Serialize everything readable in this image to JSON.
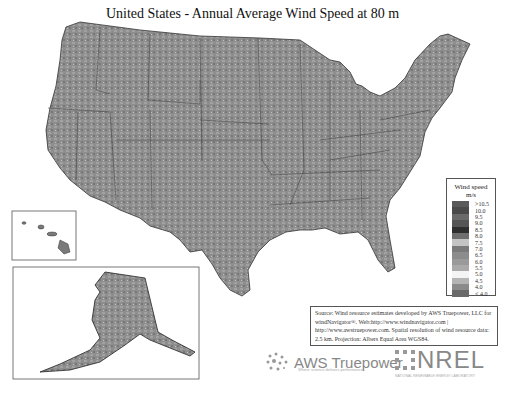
{
  "title": "United States - Annual Average Wind Speed at 80 m",
  "legend": {
    "title_line1": "Wind speed",
    "title_line2": "m/s",
    "entries": [
      {
        "label": ">10.5",
        "color": "#5a5a5a"
      },
      {
        "label": "10.0",
        "color": "#4a4a4a"
      },
      {
        "label": "9.5",
        "color": "#6a6a6a"
      },
      {
        "label": "9.0",
        "color": "#555555"
      },
      {
        "label": "8.5",
        "color": "#2e2e2e"
      },
      {
        "label": "8.0",
        "color": "#6e6e6e"
      },
      {
        "label": "7.5",
        "color": "#c4c4c4"
      },
      {
        "label": "7.0",
        "color": "#7a7a7a"
      },
      {
        "label": "6.5",
        "color": "#8c8c8c"
      },
      {
        "label": "6.0",
        "color": "#9a9a9a"
      },
      {
        "label": "5.5",
        "color": "#aaaaaa"
      },
      {
        "label": "5.0",
        "color": "#f4f4f4"
      },
      {
        "label": "4.5",
        "color": "#b4b4b4"
      },
      {
        "label": "4.0",
        "color": "#8a8a8a"
      },
      {
        "label": "< 4.0",
        "color": "#6a6a6a"
      }
    ]
  },
  "source": {
    "text": "Source: Wind resource estimates developed by AWS Truepower, LLC for windNavigator®. Web:http://www.windnavigator.com | http://www.awstruepower.com. Spatial resolution of wind resource data: 2.5 km. Projection: Albers Equal Area WGS84."
  },
  "logos": {
    "aws_name": "AWS Truepower",
    "aws_tagline": "Where science delivers performance",
    "nrel_name": "NREL",
    "nrel_tagline": "NATIONAL RENEWABLE ENERGY LABORATORY"
  },
  "insets": {
    "hawaii": "Hawaii",
    "alaska": "Alaska"
  }
}
